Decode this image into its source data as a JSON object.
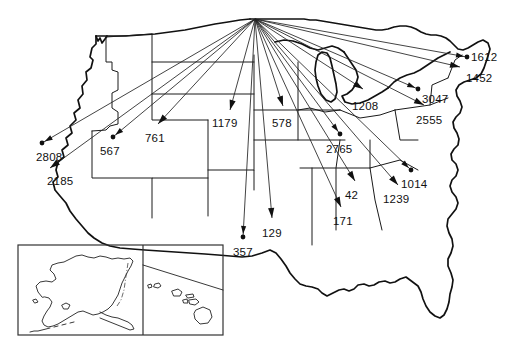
{
  "figure": {
    "width": 511,
    "height": 353,
    "background_color": "#ffffff",
    "line_color": "#111111",
    "label_color": "#111111"
  },
  "origin": {
    "name": "origin-hub",
    "x": 255,
    "y": 19
  },
  "inset": {
    "name": "alaska-hawaii-inset",
    "box_x": 18,
    "box_y": 245,
    "box_w": 205,
    "box_h": 90,
    "divider_x": 143
  },
  "chart_data": {
    "type": "flow-map",
    "origin": {
      "x": 255,
      "y": 19
    },
    "xlabel": "",
    "ylabel": "",
    "grid": false,
    "legend": "none",
    "categories": [
      "2808",
      "2185",
      "567",
      "761",
      "1179",
      "357",
      "129",
      "578",
      "2765",
      "171",
      "42",
      "1208",
      "1239",
      "1014",
      "3047",
      "2555",
      "1452",
      "1612"
    ],
    "values": [
      2808,
      2185,
      567,
      761,
      1179,
      357,
      129,
      578,
      2765,
      171,
      42,
      1208,
      1239,
      1014,
      3047,
      2555,
      1452,
      1612
    ],
    "flows": [
      {
        "label": "2808",
        "value": 2808,
        "tip_x": 42,
        "tip_y": 143,
        "label_x": 36,
        "label_y": 161,
        "anchor": "start",
        "marker": "dot"
      },
      {
        "label": "2185",
        "value": 2185,
        "tip_x": 50,
        "tip_y": 168,
        "label_x": 47,
        "label_y": 185,
        "anchor": "start",
        "marker": "arrow"
      },
      {
        "label": "567",
        "value": 567,
        "tip_x": 113,
        "tip_y": 137,
        "label_x": 100,
        "label_y": 155,
        "anchor": "start",
        "marker": "dot"
      },
      {
        "label": "761",
        "value": 761,
        "tip_x": 158,
        "tip_y": 124,
        "label_x": 145,
        "label_y": 142,
        "anchor": "start",
        "marker": "arrow"
      },
      {
        "label": "1179",
        "value": 1179,
        "tip_x": 230,
        "tip_y": 110,
        "label_x": 212,
        "label_y": 127,
        "anchor": "start",
        "marker": "arrow"
      },
      {
        "label": "357",
        "value": 357,
        "tip_x": 243,
        "tip_y": 237,
        "label_x": 233,
        "label_y": 256,
        "anchor": "start",
        "marker": "dot"
      },
      {
        "label": "129",
        "value": 129,
        "tip_x": 272,
        "tip_y": 218,
        "label_x": 262,
        "label_y": 237,
        "anchor": "start",
        "marker": "arrow"
      },
      {
        "label": "578",
        "value": 578,
        "tip_x": 283,
        "tip_y": 106,
        "label_x": 272,
        "label_y": 127,
        "anchor": "start",
        "marker": "arrow"
      },
      {
        "label": "2765",
        "value": 2765,
        "tip_x": 340,
        "tip_y": 134,
        "label_x": 326,
        "label_y": 153,
        "anchor": "start",
        "marker": "dot"
      },
      {
        "label": "171",
        "value": 171,
        "tip_x": 341,
        "tip_y": 207,
        "label_x": 333,
        "label_y": 225,
        "anchor": "start",
        "marker": "arrow"
      },
      {
        "label": "42",
        "value": 42,
        "tip_x": 355,
        "tip_y": 181,
        "label_x": 345,
        "label_y": 199,
        "anchor": "start",
        "marker": "arrow"
      },
      {
        "label": "1208",
        "value": 1208,
        "tip_x": 363,
        "tip_y": 89,
        "label_x": 352,
        "label_y": 110,
        "anchor": "start",
        "marker": "arrow"
      },
      {
        "label": "1239",
        "value": 1239,
        "tip_x": 398,
        "tip_y": 185,
        "label_x": 383,
        "label_y": 203,
        "anchor": "start",
        "marker": "arrow"
      },
      {
        "label": "1014",
        "value": 1014,
        "tip_x": 411,
        "tip_y": 170,
        "label_x": 401,
        "label_y": 188,
        "anchor": "start",
        "marker": "dot"
      },
      {
        "label": "3047",
        "value": 3047,
        "tip_x": 418,
        "tip_y": 89,
        "label_x": 422,
        "label_y": 103,
        "anchor": "start",
        "marker": "dot"
      },
      {
        "label": "2555",
        "value": 2555,
        "tip_x": 424,
        "tip_y": 105,
        "label_x": 416,
        "label_y": 124,
        "anchor": "start",
        "marker": "arrow"
      },
      {
        "label": "1452",
        "value": 1452,
        "tip_x": 460,
        "tip_y": 67,
        "label_x": 466,
        "label_y": 82,
        "anchor": "start",
        "marker": "arrow"
      },
      {
        "label": "1612",
        "value": 1612,
        "tip_x": 467,
        "tip_y": 57,
        "label_x": 471,
        "label_y": 61,
        "anchor": "start",
        "marker": "dot"
      }
    ]
  }
}
